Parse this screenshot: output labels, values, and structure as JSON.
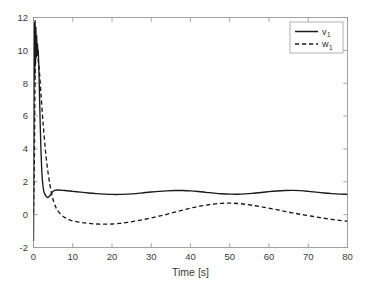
{
  "figure": {
    "background_color": "#ffffff",
    "axes_color": "#9a9a9a",
    "line_color": "#1a1a1a"
  },
  "chart_data": {
    "type": "line",
    "title": "",
    "subtitle": "",
    "xlabel": "Time [s]",
    "ylabel": "",
    "xlim": [
      0,
      80
    ],
    "ylim": [
      -2,
      12
    ],
    "xticks": [
      0,
      10,
      20,
      30,
      40,
      50,
      60,
      70,
      80
    ],
    "xtick_labels": [
      "0",
      "10",
      "20",
      "30",
      "40",
      "50",
      "60",
      "70",
      "80"
    ],
    "yticks": [
      -2,
      0,
      2,
      4,
      6,
      8,
      10,
      12
    ],
    "ytick_labels": [
      "-2",
      "0",
      "2",
      "4",
      "6",
      "8",
      "10",
      "12"
    ],
    "grid": false,
    "box": true,
    "tick_direction": "in",
    "legend": {
      "position": "upper right",
      "border": true,
      "entries": [
        {
          "label": "v",
          "subscript": "1",
          "style": "solid",
          "color": "#1a1a1a"
        },
        {
          "label": "w",
          "subscript": "1",
          "style": "dashed",
          "color": "#1a1a1a"
        }
      ]
    },
    "series": [
      {
        "name": "v1",
        "style": "solid",
        "color": "#1a1a1a",
        "x": [
          0.0,
          0.1,
          0.2,
          0.3,
          0.4,
          0.5,
          0.6,
          0.7,
          0.8,
          0.9,
          1.0,
          1.1,
          1.2,
          1.3,
          1.4,
          1.5,
          1.7,
          1.9,
          2.1,
          2.3,
          2.6,
          3.0,
          3.5,
          4.0,
          5.0,
          6.0,
          8.0,
          10.0,
          12.0,
          14.0,
          16.0,
          18.0,
          20.0,
          22.0,
          24.0,
          26.0,
          28.0,
          30.0,
          32.0,
          34.0,
          36.0,
          38.0,
          40.0,
          42.0,
          44.0,
          46.0,
          48.0,
          50.0,
          52.0,
          54.0,
          56.0,
          58.0,
          60.0,
          62.0,
          64.0,
          66.0,
          68.0,
          70.0,
          72.0,
          74.0,
          76.0,
          78.0,
          80.0
        ],
        "y": [
          -1.6,
          4.5,
          11.6,
          8.4,
          11.8,
          9.2,
          11.4,
          9.6,
          10.9,
          9.8,
          10.4,
          9.9,
          10.0,
          9.4,
          8.6,
          7.6,
          5.6,
          3.9,
          2.7,
          2.0,
          1.45,
          1.2,
          1.05,
          1.1,
          1.42,
          1.5,
          1.47,
          1.42,
          1.37,
          1.32,
          1.28,
          1.25,
          1.23,
          1.23,
          1.25,
          1.28,
          1.33,
          1.38,
          1.42,
          1.45,
          1.47,
          1.47,
          1.45,
          1.41,
          1.36,
          1.31,
          1.27,
          1.25,
          1.24,
          1.26,
          1.3,
          1.35,
          1.4,
          1.44,
          1.47,
          1.48,
          1.46,
          1.42,
          1.37,
          1.32,
          1.28,
          1.25,
          1.24
        ]
      },
      {
        "name": "w1",
        "style": "dashed",
        "color": "#1a1a1a",
        "x": [
          0.0,
          0.2,
          0.4,
          0.6,
          0.8,
          1.0,
          1.2,
          1.4,
          1.6,
          1.8,
          2.0,
          2.3,
          2.6,
          3.0,
          3.4,
          3.8,
          4.2,
          4.6,
          5.0,
          5.5,
          6.0,
          7.0,
          8.0,
          9.0,
          10.0,
          12.0,
          14.0,
          16.0,
          18.0,
          20.0,
          22.0,
          24.0,
          26.0,
          28.0,
          30.0,
          32.0,
          34.0,
          36.0,
          38.0,
          40.0,
          42.0,
          44.0,
          46.0,
          48.0,
          50.0,
          52.0,
          54.0,
          56.0,
          58.0,
          60.0,
          62.0,
          64.0,
          66.0,
          68.0,
          70.0,
          72.0,
          74.0,
          76.0,
          78.0,
          80.0
        ],
        "y": [
          0.1,
          3.0,
          8.2,
          9.8,
          10.1,
          9.6,
          9.4,
          9.0,
          8.4,
          7.7,
          7.0,
          6.0,
          5.1,
          4.0,
          3.1,
          2.4,
          1.8,
          1.3,
          0.9,
          0.55,
          0.3,
          0.0,
          -0.18,
          -0.3,
          -0.38,
          -0.47,
          -0.53,
          -0.57,
          -0.58,
          -0.57,
          -0.53,
          -0.47,
          -0.39,
          -0.3,
          -0.2,
          -0.09,
          0.02,
          0.15,
          0.28,
          0.4,
          0.5,
          0.58,
          0.65,
          0.69,
          0.7,
          0.68,
          0.63,
          0.56,
          0.48,
          0.39,
          0.3,
          0.2,
          0.11,
          0.02,
          -0.06,
          -0.14,
          -0.22,
          -0.29,
          -0.35,
          -0.4
        ]
      }
    ]
  }
}
